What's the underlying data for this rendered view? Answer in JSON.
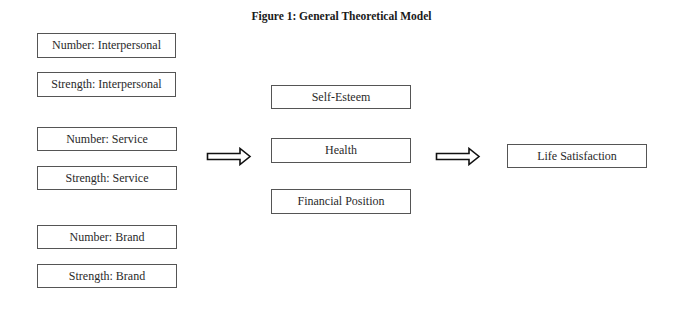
{
  "figure": {
    "title": "Figure 1: General Theoretical Model"
  },
  "diagram": {
    "inputs": [
      {
        "label": "Number: Interpersonal"
      },
      {
        "label": "Strength: Interpersonal"
      },
      {
        "label": "Number: Service"
      },
      {
        "label": "Strength: Service"
      },
      {
        "label": "Number: Brand"
      },
      {
        "label": "Strength: Brand"
      }
    ],
    "mediators": [
      {
        "label": "Self-Esteem"
      },
      {
        "label": "Health"
      },
      {
        "label": "Financial Position"
      }
    ],
    "outcome": {
      "label": "Life Satisfaction"
    },
    "arrows": [
      {
        "from": "inputs",
        "to": "mediators",
        "icon": "double-right-arrow-icon"
      },
      {
        "from": "mediators",
        "to": "outcome",
        "icon": "double-right-arrow-icon"
      }
    ]
  }
}
